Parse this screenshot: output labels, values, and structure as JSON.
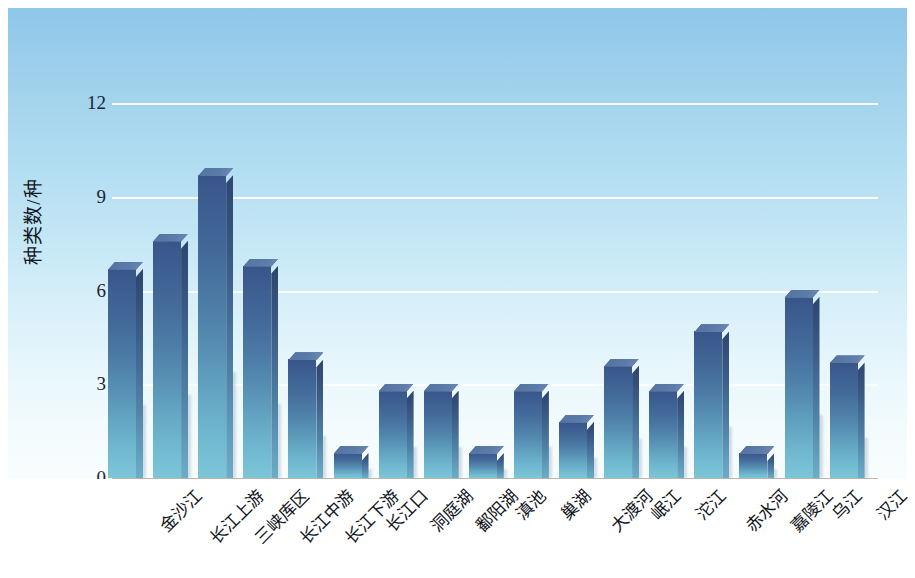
{
  "chart_data": {
    "type": "bar",
    "title": "",
    "subtitle": "",
    "xlabel": "",
    "ylabel": "种类数/种",
    "ylim": [
      0,
      13
    ],
    "yticks": [
      0,
      3,
      6,
      9,
      12
    ],
    "ytick_labels": [
      "0",
      "3",
      "6",
      "9",
      "12"
    ],
    "grid": true,
    "gridlines_at": [
      3,
      6,
      9,
      12
    ],
    "legend": null,
    "legend_position": "none",
    "series_count": 1,
    "categories": [
      "金沙江",
      "长江上游",
      "三峡库区",
      "长江中游",
      "长江下游",
      "长江口",
      "洞庭湖",
      "鄱阳湖",
      "滇池",
      "巢湖",
      "大渡河",
      "岷江",
      "沱江",
      "赤水河",
      "嘉陵江",
      "乌江",
      "汉江"
    ],
    "values": [
      6.7,
      7.6,
      9.7,
      6.8,
      3.8,
      0.8,
      2.8,
      2.8,
      0.8,
      2.8,
      1.8,
      3.6,
      2.8,
      4.7,
      0.8,
      5.8,
      3.7
    ],
    "bar_color_top": "#39558a",
    "bar_color_bottom": "#7cc6d8",
    "background_top": "#8ec7e9",
    "background_bottom": "#f8fdfe",
    "gridline_color": "#ffffff",
    "axis_color": "#b9b7ae",
    "text_color": "#12161f"
  }
}
